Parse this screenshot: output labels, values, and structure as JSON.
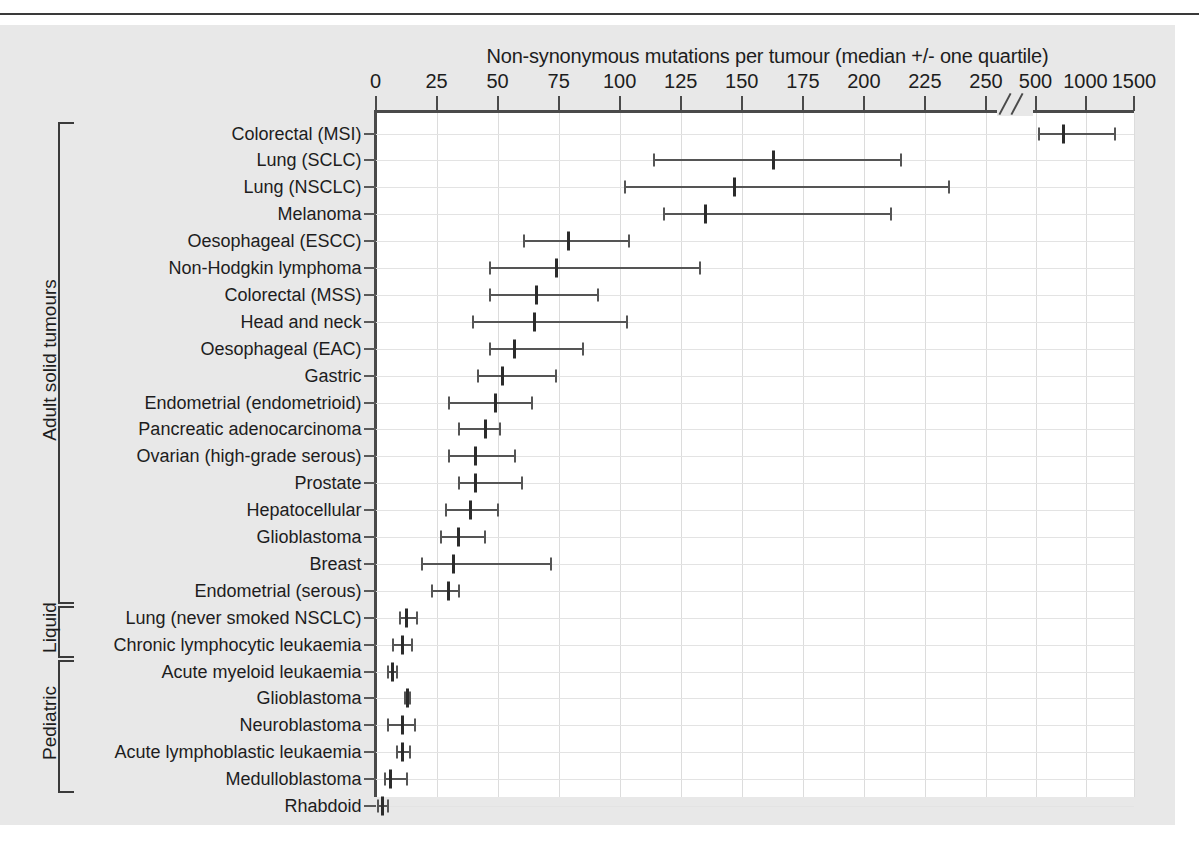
{
  "figure": {
    "title": "Non-synonymous mutations per tumour (median +/- one quartile)",
    "background_color": "#e8e8e8",
    "plot_color": "#ffffff",
    "marker_color": "#2b2b2b",
    "whisker_color": "#555555"
  },
  "axis": {
    "tick_labels": [
      "0",
      "25",
      "50",
      "75",
      "100",
      "125",
      "150",
      "175",
      "200",
      "225",
      "250",
      "500",
      "1000",
      "1500"
    ],
    "break_marker": "//"
  },
  "groups": [
    {
      "label": "Adult solid tumours",
      "first_row": 0,
      "last_row": 17
    },
    {
      "label": "Liquid",
      "first_row": 18,
      "last_row": 19
    },
    {
      "label": "Pediatric",
      "first_row": 20,
      "last_row": 24
    }
  ],
  "chart_data": {
    "type": "scatter",
    "title": "Non-synonymous mutations per tumour (median +/- one quartile)",
    "xlabel": "Non-synonymous mutations per tumour",
    "ylabel": "",
    "xlim": [
      0,
      1500
    ],
    "axis_break": {
      "after": 250,
      "resumes_at": 500
    },
    "xticks": [
      0,
      25,
      50,
      75,
      100,
      125,
      150,
      175,
      200,
      225,
      250,
      500,
      1000,
      1500
    ],
    "grid": true,
    "legend": "none",
    "value_keys": [
      "lower_quartile",
      "median",
      "upper_quartile"
    ],
    "categories": [
      "Colorectal (MSI)",
      "Lung (SCLC)",
      "Lung (NSCLC)",
      "Melanoma",
      "Oesophageal (ESCC)",
      "Non-Hodgkin lymphoma",
      "Colorectal (MSS)",
      "Head and neck",
      "Oesophageal (EAC)",
      "Gastric",
      "Endometrial (endometrioid)",
      "Pancreatic adenocarcinoma",
      "Ovarian (high-grade serous)",
      "Prostate",
      "Hepatocellular",
      "Glioblastoma",
      "Breast",
      "Endometrial (serous)",
      "Lung (never smoked NSCLC)",
      "Chronic lymphocytic leukaemia",
      "Acute myeloid leukaemia",
      "Glioblastoma",
      "Neuroblastoma",
      "Acute lymphoblastic leukaemia",
      "Medulloblastoma",
      "Rhabdoid"
    ],
    "rows": [
      {
        "label": "Colorectal (MSI)",
        "group": "Adult solid tumours",
        "lower_quartile": 530,
        "median": 777,
        "upper_quartile": 1300
      },
      {
        "label": "Lung (SCLC)",
        "group": "Adult solid tumours",
        "lower_quartile": 114,
        "median": 163,
        "upper_quartile": 215
      },
      {
        "label": "Lung (NSCLC)",
        "group": "Adult solid tumours",
        "lower_quartile": 102,
        "median": 147,
        "upper_quartile": 235
      },
      {
        "label": "Melanoma",
        "group": "Adult solid tumours",
        "lower_quartile": 118,
        "median": 135,
        "upper_quartile": 211
      },
      {
        "label": "Oesophageal (ESCC)",
        "group": "Adult solid tumours",
        "lower_quartile": 61,
        "median": 79,
        "upper_quartile": 104
      },
      {
        "label": "Non-Hodgkin lymphoma",
        "group": "Adult solid tumours",
        "lower_quartile": 47,
        "median": 74,
        "upper_quartile": 133
      },
      {
        "label": "Colorectal (MSS)",
        "group": "Adult solid tumours",
        "lower_quartile": 47,
        "median": 66,
        "upper_quartile": 91
      },
      {
        "label": "Head and neck",
        "group": "Adult solid tumours",
        "lower_quartile": 40,
        "median": 65,
        "upper_quartile": 103
      },
      {
        "label": "Oesophageal (EAC)",
        "group": "Adult solid tumours",
        "lower_quartile": 47,
        "median": 57,
        "upper_quartile": 85
      },
      {
        "label": "Gastric",
        "group": "Adult solid tumours",
        "lower_quartile": 42,
        "median": 52,
        "upper_quartile": 74
      },
      {
        "label": "Endometrial (endometrioid)",
        "group": "Adult solid tumours",
        "lower_quartile": 30,
        "median": 49,
        "upper_quartile": 64
      },
      {
        "label": "Pancreatic adenocarcinoma",
        "group": "Adult solid tumours",
        "lower_quartile": 34,
        "median": 45,
        "upper_quartile": 51
      },
      {
        "label": "Ovarian (high-grade serous)",
        "group": "Adult solid tumours",
        "lower_quartile": 30,
        "median": 41,
        "upper_quartile": 57
      },
      {
        "label": "Prostate",
        "group": "Adult solid tumours",
        "lower_quartile": 34,
        "median": 41,
        "upper_quartile": 60
      },
      {
        "label": "Hepatocellular",
        "group": "Adult solid tumours",
        "lower_quartile": 29,
        "median": 39,
        "upper_quartile": 50
      },
      {
        "label": "Glioblastoma",
        "group": "Adult solid tumours",
        "lower_quartile": 27,
        "median": 34,
        "upper_quartile": 45
      },
      {
        "label": "Breast",
        "group": "Adult solid tumours",
        "lower_quartile": 19,
        "median": 32,
        "upper_quartile": 72
      },
      {
        "label": "Endometrial (serous)",
        "group": "Adult solid tumours",
        "lower_quartile": 23,
        "median": 30,
        "upper_quartile": 34
      },
      {
        "label": "Lung (never smoked NSCLC)",
        "group": "Liquid",
        "lower_quartile": 10,
        "median": 12.5,
        "upper_quartile": 17
      },
      {
        "label": "Chronic lymphocytic leukaemia",
        "group": "Liquid",
        "lower_quartile": 7,
        "median": 11,
        "upper_quartile": 15
      },
      {
        "label": "Acute myeloid leukaemia",
        "group": "Liquid",
        "lower_quartile": 5,
        "median": 7,
        "upper_quartile": 9
      },
      {
        "label": "Glioblastoma",
        "group": "Pediatric",
        "lower_quartile": 12,
        "median": 13,
        "upper_quartile": 14
      },
      {
        "label": "Neuroblastoma",
        "group": "Pediatric",
        "lower_quartile": 5,
        "median": 11,
        "upper_quartile": 16
      },
      {
        "label": "Acute lymphoblastic leukaemia",
        "group": "Pediatric",
        "lower_quartile": 9,
        "median": 11,
        "upper_quartile": 14
      },
      {
        "label": "Medulloblastoma",
        "group": "Pediatric",
        "lower_quartile": 4,
        "median": 6,
        "upper_quartile": 13
      },
      {
        "label": "Rhabdoid",
        "group": "Pediatric",
        "lower_quartile": 1,
        "median": 3,
        "upper_quartile": 5
      }
    ]
  }
}
